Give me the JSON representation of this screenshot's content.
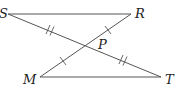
{
  "diagram": {
    "type": "geometry",
    "points": {
      "S": {
        "label": "S",
        "x": 8,
        "y": 14
      },
      "R": {
        "label": "R",
        "x": 131,
        "y": 14
      },
      "M": {
        "label": "M",
        "x": 40,
        "y": 77
      },
      "T": {
        "label": "T",
        "x": 161,
        "y": 77
      },
      "P": {
        "label": "P",
        "x": 86,
        "y": 45
      }
    },
    "segments": [
      {
        "from": "S",
        "to": "R"
      },
      {
        "from": "M",
        "to": "T"
      },
      {
        "from": "S",
        "to": "T"
      },
      {
        "from": "M",
        "to": "R"
      }
    ],
    "congruence_marks": [
      {
        "segment": "SP",
        "ticks": 2
      },
      {
        "segment": "PT",
        "ticks": 2
      },
      {
        "segment": "RP",
        "ticks": 1
      },
      {
        "segment": "MP",
        "ticks": 1
      }
    ],
    "colors": {
      "line": "#555555",
      "text": "#222222"
    }
  }
}
